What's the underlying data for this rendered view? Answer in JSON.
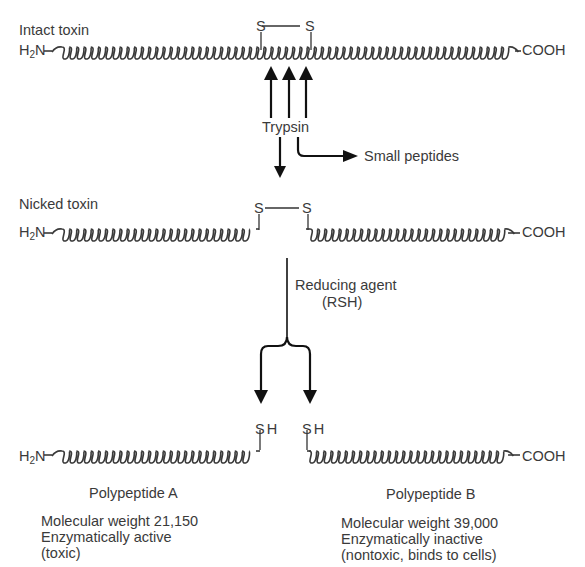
{
  "diagram": {
    "clipped_header": "",
    "stages": {
      "intact": {
        "label": "Intact toxin",
        "n_terminus": {
          "base": "H",
          "sub": "2",
          "rest": "N"
        },
        "c_terminus": "COOH",
        "disulfide": {
          "left": "S",
          "right": "S"
        }
      },
      "enzyme": {
        "label": "Trypsin",
        "byproduct": "Small peptides",
        "cleavage_arrows": 3
      },
      "nicked": {
        "label": "Nicked toxin",
        "n_terminus": {
          "base": "H",
          "sub": "2",
          "rest": "N"
        },
        "c_terminus": "COOH",
        "disulfide": {
          "left": "S",
          "right": "S"
        }
      },
      "reduction": {
        "label_line1": "Reducing agent",
        "label_line2": "(RSH)"
      },
      "products": {
        "a": {
          "n_terminus": {
            "base": "H",
            "sub": "2",
            "rest": "N"
          },
          "thiol": "SH",
          "name": "Polypeptide A",
          "mw": "Molecular weight 21,150",
          "activity": "Enzymatically active",
          "note": "(toxic)"
        },
        "b": {
          "c_terminus": "COOH",
          "thiol": "SH",
          "name": "Polypeptide B",
          "mw": "Molecular weight 39,000",
          "activity": "Enzymatically inactive",
          "note": "(nontoxic, binds to cells)"
        }
      }
    },
    "colors": {
      "line": "#2a2a2a",
      "text": "#3a3a3a",
      "arrow": "#111111"
    }
  }
}
